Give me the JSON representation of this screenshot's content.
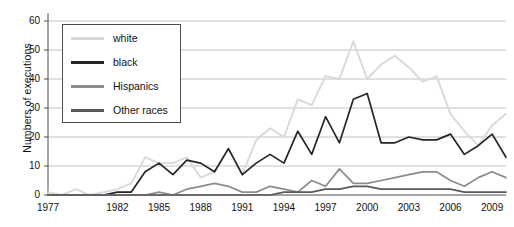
{
  "chart_data": {
    "type": "line",
    "title": "",
    "xlabel": "",
    "ylabel": "Numbers of executions",
    "ylim": [
      0,
      60
    ],
    "yticks": [
      0,
      10,
      20,
      30,
      40,
      50,
      60
    ],
    "xlim": [
      1977,
      2010
    ],
    "xticks": [
      1977,
      1982,
      1985,
      1988,
      1991,
      1994,
      1997,
      2000,
      2003,
      2006,
      2009
    ],
    "grid": "horizontal",
    "legend_position": "upper-left-inside",
    "x": [
      1977,
      1978,
      1979,
      1980,
      1981,
      1982,
      1983,
      1984,
      1985,
      1986,
      1987,
      1988,
      1989,
      1990,
      1991,
      1992,
      1993,
      1994,
      1995,
      1996,
      1997,
      1998,
      1999,
      2000,
      2001,
      2002,
      2003,
      2004,
      2005,
      2006,
      2007,
      2008,
      2009,
      2010
    ],
    "series": [
      {
        "name": "white",
        "color": "#d9d9d9",
        "values": [
          1,
          0,
          2,
          0,
          1,
          2,
          4,
          13,
          11,
          11,
          13,
          6,
          8,
          16,
          7,
          19,
          23,
          20,
          33,
          31,
          41,
          40,
          53,
          40,
          45,
          48,
          44,
          39,
          41,
          28,
          22,
          17,
          24,
          28
        ]
      },
      {
        "name": "black",
        "color": "#262626",
        "values": [
          0,
          0,
          0,
          0,
          0,
          1,
          1,
          8,
          11,
          7,
          12,
          11,
          8,
          16,
          7,
          11,
          14,
          11,
          22,
          14,
          27,
          18,
          33,
          35,
          18,
          18,
          20,
          19,
          19,
          21,
          14,
          17,
          21,
          13
        ]
      },
      {
        "name": "Hispanics",
        "color": "#8c8c8c",
        "values": [
          0,
          0,
          0,
          0,
          0,
          0,
          0,
          0,
          1,
          0,
          2,
          3,
          4,
          3,
          1,
          1,
          3,
          2,
          1,
          5,
          3,
          9,
          4,
          4,
          5,
          6,
          7,
          8,
          8,
          5,
          3,
          6,
          8,
          6
        ]
      },
      {
        "name": "Other races",
        "color": "#595959",
        "values": [
          0,
          0,
          0,
          0,
          0,
          0,
          0,
          0,
          0,
          0,
          0,
          0,
          0,
          0,
          0,
          0,
          0,
          1,
          1,
          1,
          2,
          2,
          3,
          3,
          2,
          2,
          2,
          2,
          2,
          2,
          1,
          1,
          1,
          1
        ]
      }
    ],
    "legend": [
      {
        "label": "white",
        "color": "#d9d9d9"
      },
      {
        "label": "black",
        "color": "#262626"
      },
      {
        "label": "Hispanics",
        "color": "#8c8c8c"
      },
      {
        "label": "Other races",
        "color": "#595959"
      }
    ]
  }
}
